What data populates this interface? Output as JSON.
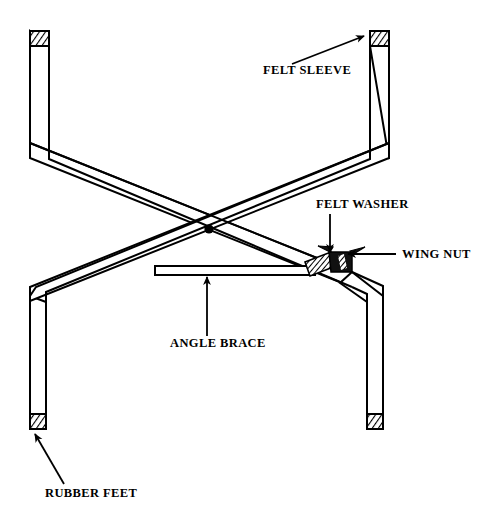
{
  "figure": {
    "background_color": "#FFFFFF",
    "line_color": "#000000",
    "fill_color": "#FFFFFF",
    "hardware_fill_color": "#000000"
  },
  "labels": {
    "felt_sleeve": "FELT SLEEVE",
    "felt_washer": "FELT WASHER",
    "wing_nut": "WING NUT",
    "angle_brace": "ANGLE BRACE",
    "rubber_feet": "RUBBER FEET"
  },
  "parts": [
    {
      "id": "felt-sleeve",
      "name": "FELT SLEEVE",
      "count": 2,
      "location": "top of both legs"
    },
    {
      "id": "felt-washer",
      "name": "FELT WASHER",
      "count": 1,
      "location": "right pivot joint"
    },
    {
      "id": "wing-nut",
      "name": "WING NUT",
      "count": 1,
      "location": "right pivot joint"
    },
    {
      "id": "angle-brace",
      "name": "ANGLE BRACE",
      "count": 1,
      "location": "horizontal cross member"
    },
    {
      "id": "rubber-feet",
      "name": "RUBBER FEET",
      "count": 2,
      "location": "bottom of both legs"
    }
  ],
  "label_positions": {
    "felt_sleeve": {
      "x": 263,
      "y": 74
    },
    "felt_washer": {
      "x": 316,
      "y": 208
    },
    "wing_nut": {
      "x": 402,
      "y": 258
    },
    "angle_brace": {
      "x": 170,
      "y": 347
    },
    "rubber_feet": {
      "x": 45,
      "y": 497
    }
  }
}
